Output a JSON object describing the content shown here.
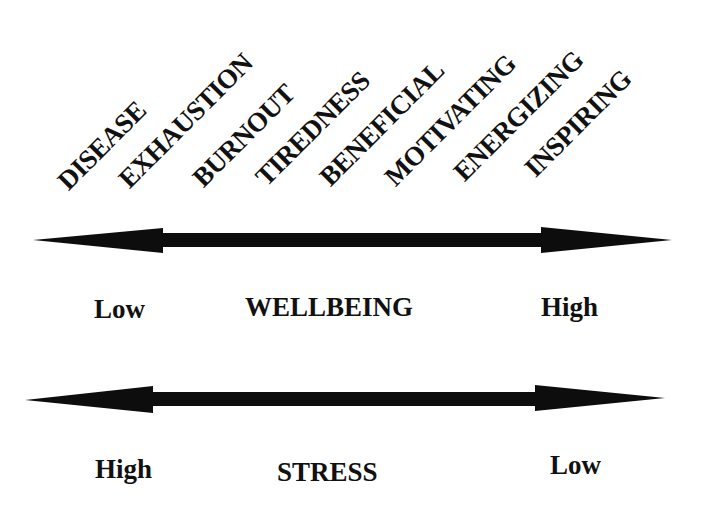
{
  "diagram": {
    "continuum_terms": [
      {
        "label": "DISEASE",
        "x": 86,
        "y": 170
      },
      {
        "label": "EXHAUSTION",
        "x": 148,
        "y": 168
      },
      {
        "label": "BURNOUT",
        "x": 221,
        "y": 167
      },
      {
        "label": "TIREDNESS",
        "x": 284,
        "y": 166
      },
      {
        "label": "BENEFICIAL",
        "x": 347,
        "y": 166
      },
      {
        "label": "MOTIVATING",
        "x": 412,
        "y": 166
      },
      {
        "label": "ENERGIZING",
        "x": 481,
        "y": 161
      },
      {
        "label": "INSPIRING",
        "x": 552,
        "y": 157
      }
    ],
    "wellbeing_axis": {
      "title": "WELLBEING",
      "left_label": "Low",
      "right_label": "High"
    },
    "stress_axis": {
      "title": "STRESS",
      "left_label": "High",
      "right_label": "Low"
    },
    "colors": {
      "arrow": "#0d0d0d",
      "text": "#111111",
      "background": "#ffffff"
    }
  }
}
